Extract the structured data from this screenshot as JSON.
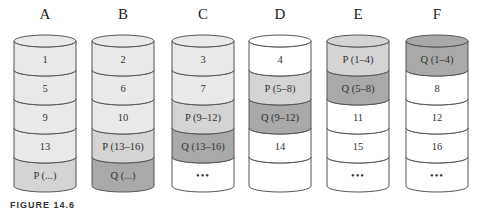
{
  "colors": {
    "data": "#e9e9e9",
    "empty": "#ffffff",
    "parity_p": "#d4d4d4",
    "parity_q": "#a9a9a9",
    "outline": "#555555"
  },
  "disks": [
    {
      "label": "A",
      "top": "data",
      "blocks": [
        {
          "text": "1",
          "type": "data"
        },
        {
          "text": "5",
          "type": "data"
        },
        {
          "text": "9",
          "type": "data"
        },
        {
          "text": "13",
          "type": "data"
        },
        {
          "text": "P (...)",
          "type": "parity_p"
        }
      ]
    },
    {
      "label": "B",
      "top": "data",
      "blocks": [
        {
          "text": "2",
          "type": "data"
        },
        {
          "text": "6",
          "type": "data"
        },
        {
          "text": "10",
          "type": "data"
        },
        {
          "text": "P (13–16)",
          "type": "parity_p"
        },
        {
          "text": "Q (...)",
          "type": "parity_q"
        }
      ]
    },
    {
      "label": "C",
      "top": "data",
      "blocks": [
        {
          "text": "3",
          "type": "data"
        },
        {
          "text": "7",
          "type": "data"
        },
        {
          "text": "P (9–12)",
          "type": "parity_p"
        },
        {
          "text": "Q (13–16)",
          "type": "parity_q"
        },
        {
          "text": "•••",
          "type": "empty"
        }
      ]
    },
    {
      "label": "D",
      "top": "empty",
      "blocks": [
        {
          "text": "4",
          "type": "empty"
        },
        {
          "text": "P (5–8)",
          "type": "parity_p"
        },
        {
          "text": "Q (9–12)",
          "type": "parity_q"
        },
        {
          "text": "14",
          "type": "empty"
        },
        {
          "text": "",
          "type": "empty"
        }
      ]
    },
    {
      "label": "E",
      "top": "parity_p",
      "blocks": [
        {
          "text": "P (1–4)",
          "type": "parity_p"
        },
        {
          "text": "Q (5–8)",
          "type": "parity_q"
        },
        {
          "text": "11",
          "type": "empty"
        },
        {
          "text": "15",
          "type": "empty"
        },
        {
          "text": "•••",
          "type": "empty"
        }
      ]
    },
    {
      "label": "F",
      "top": "parity_q",
      "blocks": [
        {
          "text": "Q (1–4)",
          "type": "parity_q"
        },
        {
          "text": "8",
          "type": "empty"
        },
        {
          "text": "12",
          "type": "empty"
        },
        {
          "text": "16",
          "type": "empty"
        },
        {
          "text": "•••",
          "type": "empty"
        }
      ]
    }
  ],
  "caption": "FIGURE 14.6"
}
